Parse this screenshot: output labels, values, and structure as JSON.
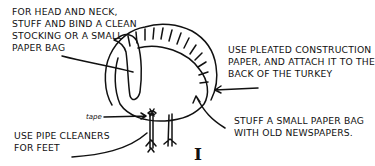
{
  "diagram": {
    "labels": {
      "head_neck": "FOR HEAD AND NECK,\nSTUFF AND BIND A CLEAN\nSTOCKING OR A SMALL\nPAPER BAG",
      "tail": "USE PLEATED CONSTRUCTION\nPAPER, AND ATTACH IT TO THE\nBACK OF THE TURKEY",
      "body": "STUFF A SMALL PAPER BAG\nWITH OLD NEWSPAPERS.",
      "feet": "USE PIPE CLEANERS\nFOR FEET",
      "tape": "tape"
    },
    "figure_number": "I"
  }
}
